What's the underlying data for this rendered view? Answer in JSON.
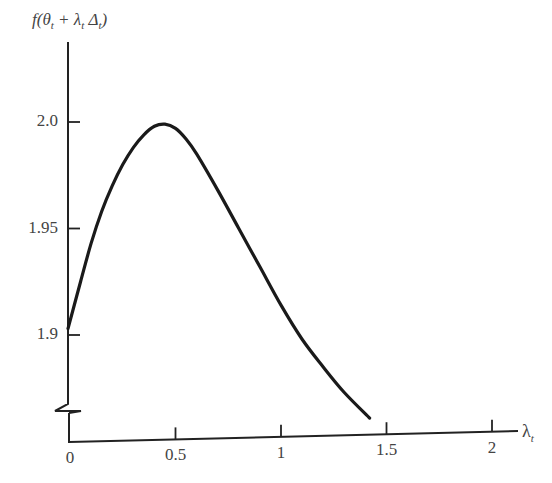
{
  "chart_data": {
    "type": "line",
    "title": "",
    "ylabel": "f(θt + λt Δt)",
    "ylabel_parts": {
      "pre": "f(θ",
      "sub1": "t",
      "mid": " + λ",
      "sub2": "t",
      "mid2": " Δ",
      "sub3": "t",
      "post": ")"
    },
    "xlabel": "λt",
    "xlabel_parts": {
      "main": "λ",
      "sub": "t"
    },
    "x_ticks": [
      "0",
      "0.5",
      "1",
      "1.5",
      "2"
    ],
    "x_tick_values": [
      0,
      0.5,
      1,
      1.5,
      2
    ],
    "y_ticks": [
      "1.9",
      "1.95",
      "2.0"
    ],
    "y_tick_values": [
      1.9,
      1.95,
      2.0
    ],
    "xlim": [
      0,
      2.1
    ],
    "ylim": [
      1.86,
      2.03
    ],
    "y_axis_break": true,
    "grid": false,
    "legend": null,
    "series": [
      {
        "name": "f",
        "x": [
          0,
          0.05,
          0.1,
          0.15,
          0.2,
          0.25,
          0.3,
          0.35,
          0.4,
          0.45,
          0.5,
          0.55,
          0.6,
          0.7,
          0.8,
          0.9,
          1.0,
          1.1,
          1.2,
          1.3,
          1.42
        ],
        "values": [
          1.903,
          1.925,
          1.943,
          1.958,
          1.97,
          1.98,
          1.988,
          1.994,
          1.998,
          1.999,
          1.997,
          1.992,
          1.985,
          1.968,
          1.95,
          1.932,
          1.914,
          1.898,
          1.885,
          1.873,
          1.861
        ]
      }
    ]
  }
}
